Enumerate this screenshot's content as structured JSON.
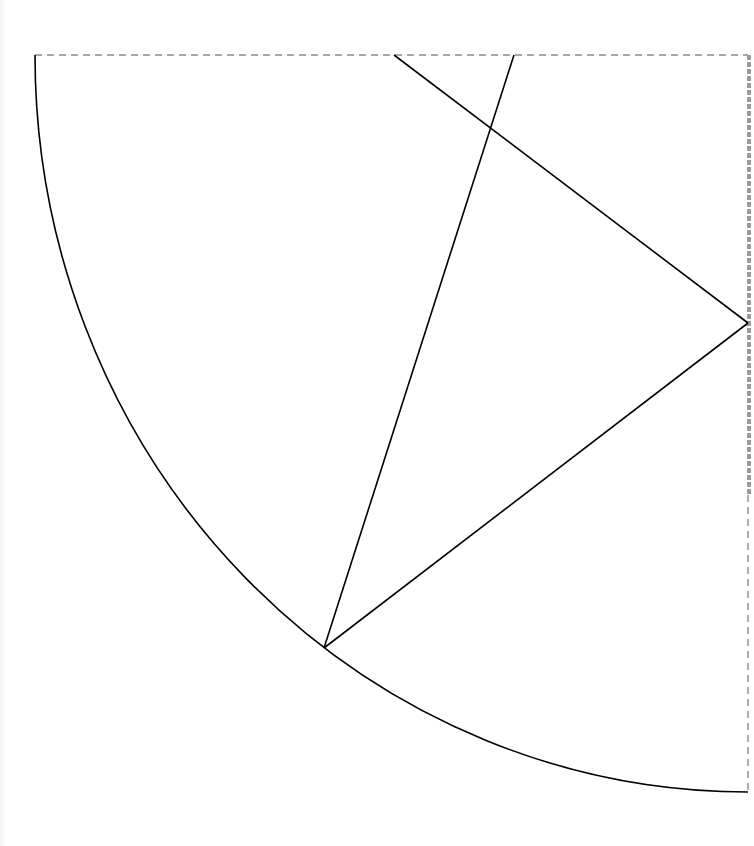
{
  "diagram": {
    "type": "geometric-construction",
    "canvas": {
      "width": 754,
      "height": 846
    },
    "colors": {
      "background": "#ffffff",
      "stroke": "#000000",
      "dashed": "#8a8a8a",
      "right_edge": "#9a9a9a"
    },
    "bounding_box": {
      "style": "dashed",
      "x1": 35,
      "y1": 55,
      "x2": 748,
      "y2": 792
    },
    "arc": {
      "style": "solid",
      "center": [
        748,
        55
      ],
      "radius_x": 713,
      "radius_y": 737,
      "start": [
        35,
        55
      ],
      "end": [
        748,
        792
      ]
    },
    "segments": [
      {
        "id": "segment-a",
        "from": [
          394,
          55
        ],
        "to": [
          748,
          323
        ]
      },
      {
        "id": "segment-b",
        "from": [
          748,
          323
        ],
        "to": [
          324,
          648
        ]
      },
      {
        "id": "segment-c",
        "from": [
          514,
          55
        ],
        "to": [
          324,
          648
        ]
      }
    ],
    "points": [
      {
        "id": "top-left-corner",
        "at": [
          35,
          55
        ]
      },
      {
        "id": "top-point-a",
        "at": [
          394,
          55
        ]
      },
      {
        "id": "top-point-c",
        "at": [
          514,
          55
        ]
      },
      {
        "id": "right-vertex",
        "at": [
          748,
          323
        ]
      },
      {
        "id": "arc-vertex",
        "at": [
          324,
          648
        ]
      },
      {
        "id": "arc-end",
        "at": [
          748,
          792
        ]
      },
      {
        "id": "intersection",
        "at": [
          490,
          125
        ]
      }
    ]
  }
}
